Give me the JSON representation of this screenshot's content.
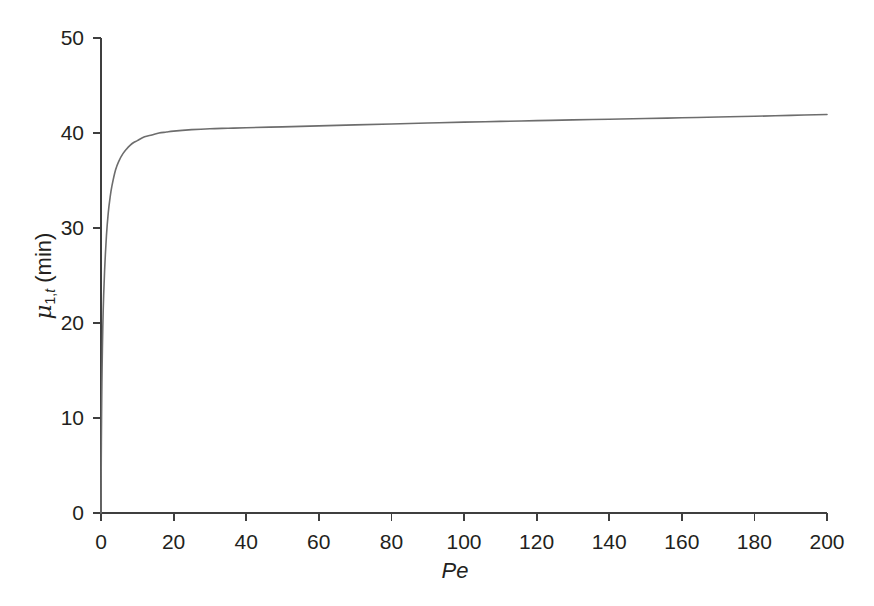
{
  "figure": {
    "background_color": "#ffffff",
    "axis_color": "#3f3f3f",
    "text_color": "#231f20",
    "curve_color": "#6d6d6d"
  },
  "axes": {
    "x_title": "Pe",
    "y_title_mu": "μ",
    "y_title_sub_pre": "1,",
    "y_title_sub_it": "t",
    "y_title_unit": " (min)",
    "x_ticks": [
      "0",
      "20",
      "40",
      "60",
      "80",
      "100",
      "120",
      "140",
      "160",
      "180",
      "200"
    ],
    "y_ticks": [
      "0",
      "10",
      "20",
      "30",
      "40",
      "50"
    ]
  },
  "chart_data": {
    "type": "line",
    "title": "",
    "xlabel": "Pe",
    "ylabel": "μ1,t (min)",
    "xlim": [
      0,
      200
    ],
    "ylim": [
      0,
      50
    ],
    "xticks": [
      0,
      20,
      40,
      60,
      80,
      100,
      120,
      140,
      160,
      180,
      200
    ],
    "yticks": [
      0,
      10,
      20,
      30,
      40,
      50
    ],
    "grid": false,
    "legend": null,
    "series": [
      {
        "name": "mu_1,t vs Pe",
        "color": "#6d6d6d",
        "line_width": 1.6,
        "x": [
          0,
          0.05,
          0.1,
          0.2,
          0.3,
          0.5,
          0.7,
          1,
          1.5,
          2,
          2.5,
          3,
          4,
          5,
          6,
          7,
          8,
          9,
          10,
          12,
          14,
          16,
          18,
          20,
          25,
          30,
          35,
          40,
          50,
          60,
          70,
          80,
          90,
          100,
          110,
          120,
          130,
          140,
          150,
          160,
          170,
          180,
          190,
          200
        ],
        "y": [
          0.0,
          4.2,
          7.4,
          12.0,
          15.2,
          19.6,
          22.5,
          25.6,
          29.2,
          31.6,
          33.2,
          34.4,
          36.1,
          37.1,
          37.8,
          38.3,
          38.7,
          39.0,
          39.2,
          39.6,
          39.8,
          40.0,
          40.1,
          40.2,
          40.35,
          40.45,
          40.5,
          40.55,
          40.65,
          40.75,
          40.85,
          40.95,
          41.05,
          41.15,
          41.22,
          41.3,
          41.38,
          41.45,
          41.52,
          41.6,
          41.68,
          41.76,
          41.86,
          41.95
        ]
      }
    ]
  },
  "geometry": {
    "plot_left": 101,
    "plot_right": 827,
    "plot_top": 38,
    "plot_bottom": 513,
    "tick_len": 8
  }
}
